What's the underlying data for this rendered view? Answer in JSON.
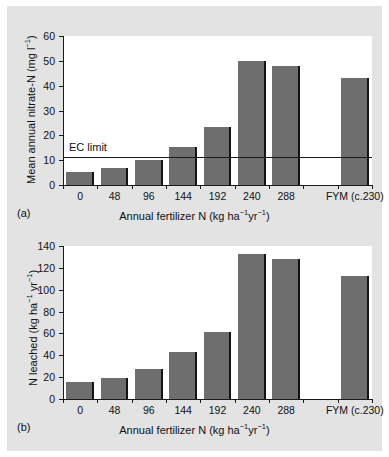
{
  "figure": {
    "panel_a_label": "(a)",
    "panel_b_label": "(b)",
    "background_color": "#e3e3e3",
    "plot_background_color": "#ffffff",
    "bar_color": "#6e6e6e",
    "bar_edge_color": "#141414",
    "axis_color": "#1a1a1a"
  },
  "chart_data": [
    {
      "type": "bar",
      "panel": "(a)",
      "title": "",
      "xlabel": "Annual fertilizer N (kg ha⁻¹yr⁻¹)",
      "ylabel": "Mean annual nitrate-N (mg l⁻¹)",
      "categories": [
        "0",
        "48",
        "96",
        "144",
        "192",
        "240",
        "288",
        "",
        "FYM (c.230)"
      ],
      "values": [
        5.3,
        6.8,
        10.2,
        15.3,
        23.2,
        49.8,
        48.0,
        null,
        43.0
      ],
      "ylim": [
        0,
        60
      ],
      "yticks": [
        0,
        10,
        20,
        30,
        40,
        50,
        60
      ],
      "grid": false,
      "legend": "none",
      "annotations": [
        {
          "label": "EC limit",
          "type": "hline",
          "value": 11.3
        }
      ]
    },
    {
      "type": "bar",
      "panel": "(b)",
      "title": "",
      "xlabel": "Annual fertilizer N (kg ha⁻¹yr⁻¹)",
      "ylabel": "N leached (kg ha⁻¹ yr⁻¹)",
      "categories": [
        "0",
        "48",
        "96",
        "144",
        "192",
        "240",
        "288",
        "",
        "FYM (c.230)"
      ],
      "values": [
        16.0,
        19.5,
        27.5,
        43.0,
        61.0,
        133.0,
        128.5,
        null,
        112.5
      ],
      "ylim": [
        0,
        140
      ],
      "yticks": [
        0,
        20,
        40,
        60,
        80,
        100,
        120,
        140
      ],
      "grid": false,
      "legend": "none",
      "annotations": []
    }
  ]
}
